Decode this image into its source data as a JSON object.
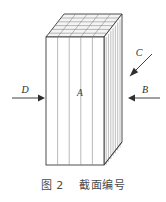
{
  "figure": {
    "caption": "图 2    截面编号",
    "caption_label": "图 2",
    "caption_text": "截面编号",
    "body_label": "A",
    "arrow_labels": {
      "left": "D",
      "right": "B",
      "diagonal": "C"
    },
    "colors": {
      "outline": "#3a3a3a",
      "inner_line": "#8a8a8a",
      "face": "#ffffff",
      "top_face": "#f2f2f2",
      "side_face": "#fbfbfb",
      "text": "#3a3a3a",
      "caption_text": "#4a4a4a"
    },
    "geometry": {
      "front_left_x": 46,
      "front_right_x": 104,
      "front_top_y": 37,
      "front_bottom_y": 165,
      "depth_dx": 18,
      "depth_dy": -23,
      "front_slice_count": 5,
      "top_grid_rows": 6,
      "top_grid_cols": 5,
      "side_slice_count": 7
    }
  }
}
